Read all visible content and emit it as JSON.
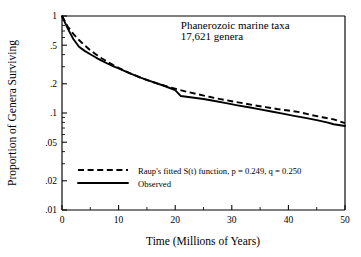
{
  "chart_data": {
    "type": "line",
    "title": "",
    "xlabel": "Time (Millions of Years)",
    "ylabel": "Proportion of Genera Surviving",
    "xlim": [
      0,
      50
    ],
    "ylim": [
      0.01,
      1
    ],
    "yscale": "log",
    "xscale": "linear",
    "grid": false,
    "legend_position": "lower-left-inside",
    "x_ticks": [
      0,
      10,
      20,
      30,
      40,
      50
    ],
    "x_tick_labels": [
      "0",
      "10",
      "20",
      "30",
      "40",
      "50"
    ],
    "x_minor_ticks": [
      5,
      15,
      25,
      35,
      45
    ],
    "y_ticks": [
      1,
      0.5,
      0.2,
      0.1,
      0.05,
      0.02,
      0.01
    ],
    "y_tick_labels": [
      "1",
      ".5",
      ".2",
      ".1",
      ".05",
      ".02",
      ".01"
    ],
    "y_minor_ticks": [
      0.9,
      0.8,
      0.7,
      0.6,
      0.4,
      0.3,
      0.09,
      0.08,
      0.07,
      0.06,
      0.04,
      0.03
    ],
    "annotations": [
      {
        "name": "taxa-label",
        "text": "Phanerozoic marine taxa",
        "x": 21.0,
        "y": 0.74
      },
      {
        "name": "genera-count-label",
        "text": "17,621 genera",
        "x": 21.0,
        "y": 0.56
      }
    ],
    "series": [
      {
        "name": "Raup's fitted S(t) function, p = 0.249, q = 0.250",
        "style": "dashed",
        "color": "#000000",
        "x": [
          0,
          1,
          2,
          3,
          4,
          5,
          6,
          7,
          8,
          9,
          10,
          12,
          14,
          16,
          18,
          20,
          22,
          24,
          26,
          28,
          30,
          32,
          34,
          36,
          38,
          40,
          42,
          44,
          46,
          48,
          50
        ],
        "y": [
          1.0,
          0.78,
          0.655,
          0.565,
          0.497,
          0.444,
          0.402,
          0.367,
          0.338,
          0.313,
          0.292,
          0.257,
          0.23,
          0.209,
          0.192,
          0.178,
          0.166,
          0.156,
          0.147,
          0.139,
          0.132,
          0.126,
          0.12,
          0.115,
          0.11,
          0.106,
          0.102,
          0.0955,
          0.0905,
          0.086,
          0.0785
        ]
      },
      {
        "name": "Observed",
        "style": "solid",
        "color": "#000000",
        "x": [
          0,
          1,
          2,
          3,
          4,
          5,
          6,
          7,
          8,
          9,
          10,
          12,
          14,
          16,
          18,
          20,
          21,
          23,
          25,
          27,
          29,
          31,
          33,
          35,
          37,
          39,
          41,
          43,
          45,
          47,
          48,
          50
        ],
        "y": [
          1.0,
          0.745,
          0.58,
          0.482,
          0.437,
          0.403,
          0.373,
          0.347,
          0.324,
          0.305,
          0.288,
          0.256,
          0.23,
          0.209,
          0.191,
          0.172,
          0.1495,
          0.1445,
          0.1395,
          0.133,
          0.1265,
          0.12,
          0.1145,
          0.109,
          0.1035,
          0.0985,
          0.0935,
          0.089,
          0.0845,
          0.0795,
          0.0765,
          0.0735
        ]
      }
    ],
    "legend": {
      "entries": [
        {
          "label": "Raup's  fitted S(t) function, p = 0.249, q = 0.250",
          "style": "dashed"
        },
        {
          "label": "Observed",
          "style": "solid"
        }
      ]
    },
    "fit_parameters": {
      "p": 0.249,
      "q": 0.25
    },
    "colors": {
      "line": "#000000",
      "axis": "#000000",
      "background": "#ffffff"
    }
  }
}
